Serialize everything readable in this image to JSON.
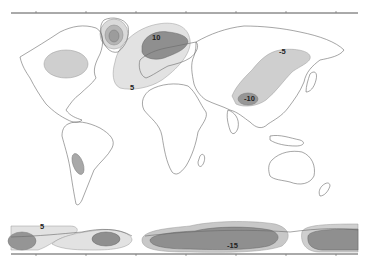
{
  "map": {
    "type": "world contour anomaly map",
    "colors": {
      "level_light": "#e3e3e3",
      "level_mid": "#c4c4c4",
      "level_dark": "#8f8f8f",
      "coastline": "#6a6a6a",
      "axis": "#555555"
    },
    "contour_labels": [
      {
        "id": "north-atlantic-high",
        "text": "10"
      },
      {
        "id": "north-atlantic-outer",
        "text": "5"
      },
      {
        "id": "siberia-outer",
        "text": "-5"
      },
      {
        "id": "central-asia-inner",
        "text": "-10"
      },
      {
        "id": "southern-ocean-west",
        "text": "5"
      },
      {
        "id": "southern-ocean-indian",
        "text": "-15"
      }
    ]
  }
}
